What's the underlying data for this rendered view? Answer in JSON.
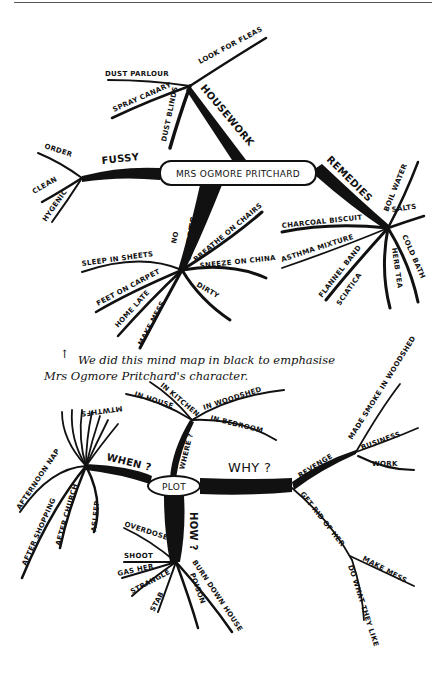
{
  "map1": {
    "center": "MRS OGMORE PRITCHARD",
    "housework": {
      "label": "HOUSEWORK",
      "children": [
        "DUST PARLOUR",
        "LOOK FOR FLEAS",
        "SPRAY CANARY",
        "DUST BLINDS"
      ]
    },
    "fussy": {
      "label": "FUSSY",
      "children": [
        "ORDER",
        "CLEAN",
        "HYGENIC"
      ]
    },
    "remedies": {
      "label": "REMEDIES",
      "salts": "SALTS",
      "children": [
        "BOIL WATER",
        "CHARCOAL BISCUIT",
        "ASTHMA MIXTURE",
        "FLANNEL BAND",
        "SCIATICA",
        "HERB TEA",
        "COLD BATH"
      ]
    },
    "guests": {
      "label": "NO GUESTS",
      "prefix": "NO",
      "word": "GUESTS",
      "children": [
        "SLEEP IN SHEETS",
        "FEET ON CARPET",
        "HOME LATE",
        "MAKE MESS",
        "BREATHE ON CHAIRS",
        "SNEEZE ON CHINA",
        "DIRTY"
      ]
    }
  },
  "note": {
    "arrow": "↑",
    "line1": "We did this mind map in black to emphasise",
    "line2": "Mrs Ogmore Pritchard's character."
  },
  "map2": {
    "center": "PLOT",
    "when": {
      "label": "WHEN ?",
      "days": "MTWTHFS",
      "children": [
        "AFTERNOON NAP",
        "AFTER SHOPPING",
        "AFTER CHURCH",
        "ASLEEP"
      ]
    },
    "where": {
      "label": "WHERE ?",
      "children": [
        "IN HOUSE",
        "IN KITCHEN",
        "IN WOODSHED",
        "IN BEDROOM"
      ]
    },
    "why": {
      "label": "WHY ?",
      "revenge": {
        "label": "REVENGE",
        "children": [
          "MADE SMOKE IN WOODSHED",
          "BUSINESS",
          "WORK"
        ]
      },
      "get_rid": {
        "label": "GET RID OF HER",
        "children": [
          "MAKE MESS",
          "DO WHAT THEY LIKE"
        ]
      }
    },
    "how": {
      "label": "HOW ?",
      "children": [
        "OVERDOSE",
        "SHOOT",
        "GAS HER",
        "STRANGLE",
        "STAB",
        "POISON",
        "BURN DOWN HOUSE"
      ]
    }
  }
}
